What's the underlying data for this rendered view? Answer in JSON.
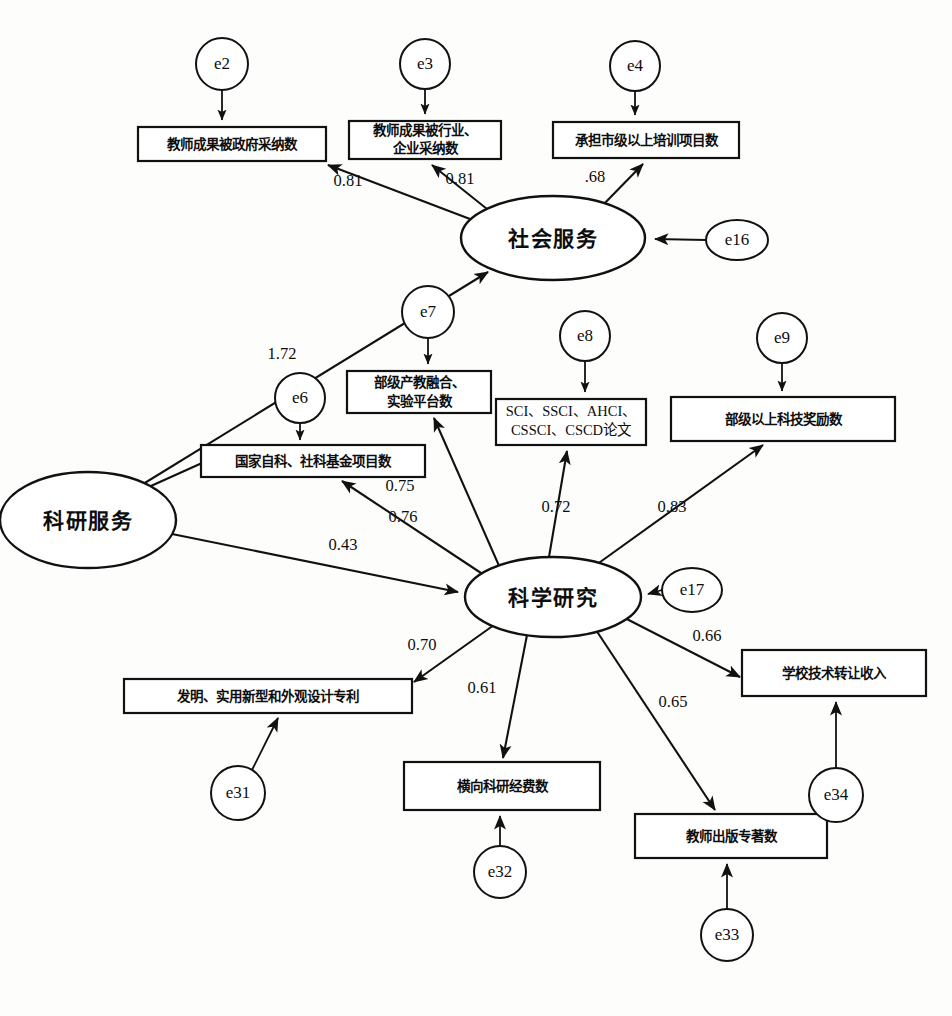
{
  "figure": {
    "type": "structural-equation-model-path-diagram",
    "background_color": "#fdfdfc",
    "stroke_color": "#111111"
  },
  "latent_variables": [
    {
      "id": "social_service",
      "label": "社会服务",
      "cx": 553,
      "cy": 238,
      "rx": 92,
      "ry": 42
    },
    {
      "id": "research_service",
      "label": "科研服务",
      "cx": 88,
      "cy": 520,
      "rx": 88,
      "ry": 48
    },
    {
      "id": "scientific_research",
      "label": "科学研究",
      "cx": 553,
      "cy": 597,
      "rx": 88,
      "ry": 40
    }
  ],
  "observed_variables": [
    {
      "id": "gov_adopt",
      "label": "教师成果被政府采纳数",
      "lines": [
        "教师成果被政府采纳数"
      ],
      "x": 138,
      "y": 127,
      "w": 188,
      "h": 34
    },
    {
      "id": "industry_adopt",
      "label": "教师成果被行业、企业采纳数",
      "lines": [
        "教师成果被行业、",
        "企业采纳数"
      ],
      "x": 349,
      "y": 121,
      "w": 152,
      "h": 38
    },
    {
      "id": "city_training",
      "label": "承担市级以上培训项目数",
      "lines": [
        "承担市级以上培训项目数"
      ],
      "x": 553,
      "y": 122,
      "w": 186,
      "h": 36
    },
    {
      "id": "industry_edu_platform",
      "label": "部级产教融合、实验平台数",
      "lines": [
        "部级产教融合、",
        "实验平台数"
      ],
      "x": 347,
      "y": 371,
      "w": 144,
      "h": 42
    },
    {
      "id": "journal_papers",
      "label": "SCI、SSCI、AHCI、CSSCI、CSCD论文",
      "lines": [
        "SCI、SSCI、AHCI、",
        "CSSCI、CSCD论文"
      ],
      "x": 496,
      "y": 399,
      "w": 150,
      "h": 46
    },
    {
      "id": "sci_tech_awards",
      "label": "部级以上科技奖励数",
      "lines": [
        "部级以上科技奖励数"
      ],
      "x": 671,
      "y": 397,
      "w": 224,
      "h": 44
    },
    {
      "id": "national_funds",
      "label": "国家自科、社科基金项目数",
      "lines": [
        "国家自科、社科基金项目数"
      ],
      "x": 201,
      "y": 445,
      "w": 224,
      "h": 32
    },
    {
      "id": "patents",
      "label": "发明、实用新型和外观设计专利",
      "lines": [
        "发明、实用新型和外观设计专利"
      ],
      "x": 124,
      "y": 679,
      "w": 288,
      "h": 34
    },
    {
      "id": "horizontal_funding",
      "label": "横向科研经费数",
      "lines": [
        "横向科研经费数"
      ],
      "x": 404,
      "y": 762,
      "w": 196,
      "h": 48
    },
    {
      "id": "published_books",
      "label": "教师出版专著数",
      "lines": [
        "教师出版专著数"
      ],
      "x": 635,
      "y": 814,
      "w": 192,
      "h": 44
    },
    {
      "id": "tech_transfer_income",
      "label": "学校技术转让收入",
      "lines": [
        "学校技术转让收入"
      ],
      "x": 742,
      "y": 650,
      "w": 184,
      "h": 46
    }
  ],
  "error_terms": [
    {
      "id": "e2",
      "label": "e2",
      "cx": 222,
      "cy": 64,
      "rx": 26,
      "ry": 26
    },
    {
      "id": "e3",
      "label": "e3",
      "cx": 425,
      "cy": 64,
      "rx": 25,
      "ry": 25
    },
    {
      "id": "e4",
      "label": "e4",
      "cx": 635,
      "cy": 66,
      "rx": 25,
      "ry": 25
    },
    {
      "id": "e16",
      "label": "e16",
      "cx": 737,
      "cy": 240,
      "rx": 31,
      "ry": 20
    },
    {
      "id": "e6",
      "label": "e6",
      "cx": 300,
      "cy": 398,
      "rx": 25,
      "ry": 25
    },
    {
      "id": "e7",
      "label": "e7",
      "cx": 428,
      "cy": 312,
      "rx": 26,
      "ry": 26
    },
    {
      "id": "e8",
      "label": "e8",
      "cx": 585,
      "cy": 336,
      "rx": 25,
      "ry": 25
    },
    {
      "id": "e9",
      "label": "e9",
      "cx": 782,
      "cy": 338,
      "rx": 25,
      "ry": 25
    },
    {
      "id": "e17",
      "label": "e17",
      "cx": 692,
      "cy": 590,
      "rx": 30,
      "ry": 22
    },
    {
      "id": "e31",
      "label": "e31",
      "cx": 238,
      "cy": 793,
      "rx": 27,
      "ry": 27
    },
    {
      "id": "e32",
      "label": "e32",
      "cx": 500,
      "cy": 872,
      "rx": 26,
      "ry": 26
    },
    {
      "id": "e33",
      "label": "e33",
      "cx": 727,
      "cy": 935,
      "rx": 26,
      "ry": 26
    },
    {
      "id": "e34",
      "label": "e34",
      "cx": 836,
      "cy": 795,
      "rx": 27,
      "ry": 27
    }
  ],
  "paths": [
    {
      "id": "p1",
      "from": "social_service",
      "to": "gov_adopt",
      "coefficient": "0.81",
      "label_x": 348,
      "label_y": 182
    },
    {
      "id": "p2",
      "from": "social_service",
      "to": "industry_adopt",
      "coefficient": "0.81",
      "label_x": 460,
      "label_y": 180
    },
    {
      "id": "p3",
      "from": "social_service",
      "to": "city_training",
      "coefficient": ".68",
      "label_x": 595,
      "label_y": 178
    },
    {
      "id": "p4",
      "from": "research_service",
      "to": "social_service",
      "coefficient": "1.72",
      "label_x": 282,
      "label_y": 355
    },
    {
      "id": "p5",
      "from": "research_service",
      "to": "national_funds",
      "coefficient": "",
      "label_x": 0,
      "label_y": 0
    },
    {
      "id": "p6",
      "from": "research_service",
      "to": "scientific_research",
      "coefficient": "0.43",
      "label_x": 343,
      "label_y": 546
    },
    {
      "id": "p7",
      "from": "scientific_research",
      "to": "industry_edu_platform",
      "coefficient": "0.75",
      "label_x": 400,
      "label_y": 487
    },
    {
      "id": "p8",
      "from": "scientific_research",
      "to": "national_funds",
      "coefficient": "0.76",
      "label_x": 403,
      "label_y": 518
    },
    {
      "id": "p9",
      "from": "scientific_research",
      "to": "journal_papers",
      "coefficient": "0.72",
      "label_x": 556,
      "label_y": 508
    },
    {
      "id": "p10",
      "from": "scientific_research",
      "to": "sci_tech_awards",
      "coefficient": "0.83",
      "label_x": 672,
      "label_y": 508
    },
    {
      "id": "p11",
      "from": "scientific_research",
      "to": "patents",
      "coefficient": "0.70",
      "label_x": 422,
      "label_y": 646
    },
    {
      "id": "p12",
      "from": "scientific_research",
      "to": "horizontal_funding",
      "coefficient": "0.61",
      "label_x": 482,
      "label_y": 689
    },
    {
      "id": "p13",
      "from": "scientific_research",
      "to": "published_books",
      "coefficient": "0.65",
      "label_x": 673,
      "label_y": 703
    },
    {
      "id": "p14",
      "from": "scientific_research",
      "to": "tech_transfer_income",
      "coefficient": "0.66",
      "label_x": 707,
      "label_y": 637
    }
  ],
  "error_paths": [
    {
      "id": "ep_e2",
      "from": "e2",
      "to": "gov_adopt"
    },
    {
      "id": "ep_e3",
      "from": "e3",
      "to": "industry_adopt"
    },
    {
      "id": "ep_e4",
      "from": "e4",
      "to": "city_training"
    },
    {
      "id": "ep_e16",
      "from": "e16",
      "to": "social_service"
    },
    {
      "id": "ep_e6",
      "from": "e6",
      "to": "national_funds"
    },
    {
      "id": "ep_e7",
      "from": "e7",
      "to": "industry_edu_platform"
    },
    {
      "id": "ep_e8",
      "from": "e8",
      "to": "journal_papers"
    },
    {
      "id": "ep_e9",
      "from": "e9",
      "to": "sci_tech_awards"
    },
    {
      "id": "ep_e17",
      "from": "e17",
      "to": "scientific_research"
    },
    {
      "id": "ep_e31",
      "from": "e31",
      "to": "patents"
    },
    {
      "id": "ep_e32",
      "from": "e32",
      "to": "horizontal_funding"
    },
    {
      "id": "ep_e33",
      "from": "e33",
      "to": "published_books"
    },
    {
      "id": "ep_e34",
      "from": "e34",
      "to": "tech_transfer_income"
    }
  ]
}
